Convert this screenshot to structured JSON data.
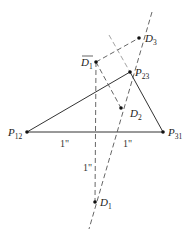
{
  "diagram": {
    "points": {
      "P12": {
        "label": "P",
        "sub": "12",
        "x": 27,
        "y": 132
      },
      "P31": {
        "label": "P",
        "sub": "31",
        "x": 163,
        "y": 132
      },
      "P23": {
        "label": "P",
        "sub": "23",
        "x": 130,
        "y": 72
      },
      "D1bar": {
        "label": "D",
        "sub": "1",
        "x": 96,
        "y": 62,
        "overbar": true
      },
      "D3": {
        "label": "D",
        "sub": "3",
        "x": 139,
        "y": 38
      },
      "D2": {
        "label": "D",
        "sub": "2",
        "x": 121,
        "y": 108
      },
      "D1": {
        "label": "D",
        "sub": "1",
        "x": 95,
        "y": 202
      }
    },
    "dimensions": [
      {
        "text": "1\"",
        "x": 62,
        "y": 146
      },
      {
        "text": "1\"",
        "x": 124,
        "y": 146
      },
      {
        "text": "1\"",
        "x": 83,
        "y": 168
      }
    ],
    "colors": {
      "line": "#333333",
      "dashed": "#555555",
      "light_dashed": "#999999"
    }
  }
}
